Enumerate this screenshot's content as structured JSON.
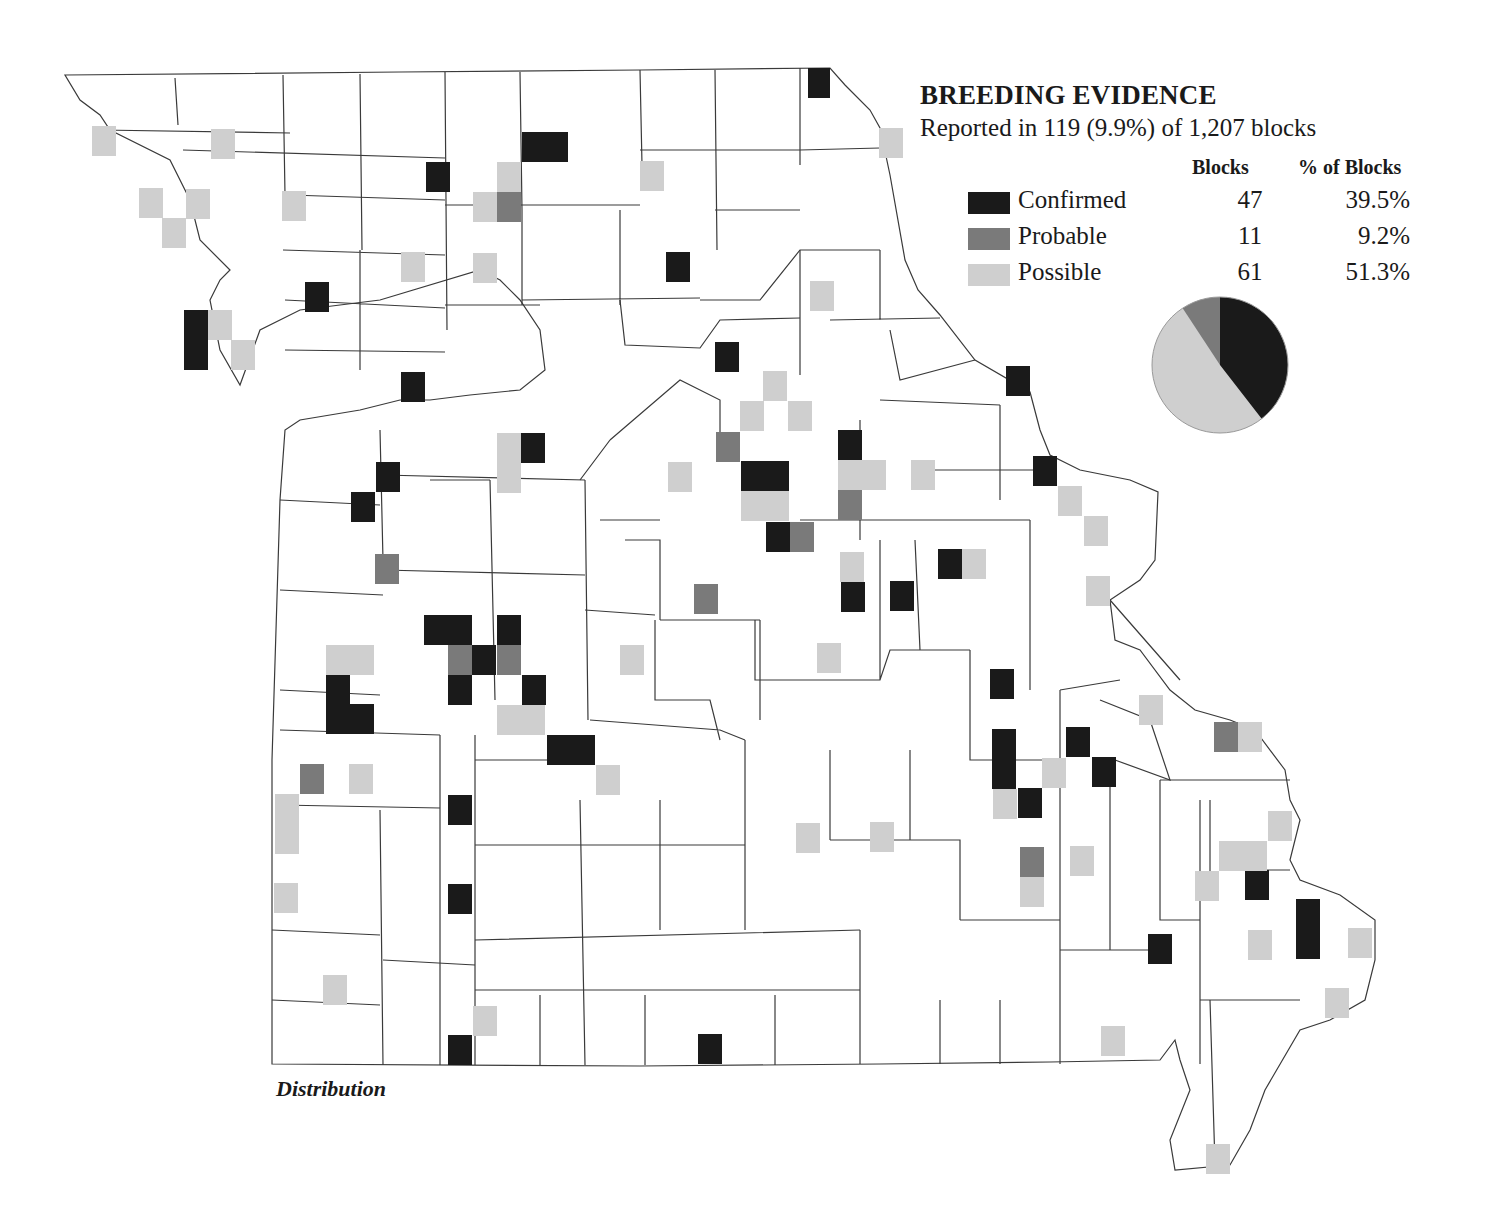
{
  "legend": {
    "title": "BREEDING EVIDENCE",
    "subtitle": "Reported in 119 (9.9%) of 1,207 blocks",
    "col_blocks": "Blocks",
    "col_pct": "% of Blocks",
    "rows": [
      {
        "label": "Confirmed",
        "blocks": "47",
        "pct": "39.5%",
        "color": "#1a1a1a"
      },
      {
        "label": "Probable",
        "blocks": "11",
        "pct": "9.2%",
        "color": "#7a7a7a"
      },
      {
        "label": "Possible",
        "blocks": "61",
        "pct": "51.3%",
        "color": "#cfcfcf"
      }
    ]
  },
  "caption": "Distribution",
  "colors": {
    "confirmed": "#1a1a1a",
    "probable": "#7a7a7a",
    "possible": "#cfcfcf",
    "line": "#333333"
  },
  "chart_data": {
    "type": "pie",
    "title": "BREEDING EVIDENCE",
    "subtitle": "Reported in 119 (9.9%) of 1,207 blocks",
    "categories": [
      "Confirmed",
      "Probable",
      "Possible"
    ],
    "values": [
      47,
      11,
      61
    ],
    "percent": [
      39.5,
      9.2,
      51.3
    ],
    "total_blocks_reported": 119,
    "total_blocks": 1207
  },
  "blocks": [
    {
      "x": 808,
      "y": 68,
      "w": 22,
      "h": 30,
      "t": "confirmed"
    },
    {
      "x": 522,
      "y": 132,
      "w": 46,
      "h": 30,
      "t": "confirmed"
    },
    {
      "x": 426,
      "y": 162,
      "w": 24,
      "h": 30,
      "t": "confirmed"
    },
    {
      "x": 666,
      "y": 252,
      "w": 24,
      "h": 30,
      "t": "confirmed"
    },
    {
      "x": 305,
      "y": 282,
      "w": 24,
      "h": 30,
      "t": "confirmed"
    },
    {
      "x": 184,
      "y": 310,
      "w": 24,
      "h": 60,
      "t": "confirmed"
    },
    {
      "x": 715,
      "y": 342,
      "w": 24,
      "h": 30,
      "t": "confirmed"
    },
    {
      "x": 401,
      "y": 372,
      "w": 24,
      "h": 30,
      "t": "confirmed"
    },
    {
      "x": 1006,
      "y": 366,
      "w": 24,
      "h": 30,
      "t": "confirmed"
    },
    {
      "x": 521,
      "y": 433,
      "w": 24,
      "h": 30,
      "t": "confirmed"
    },
    {
      "x": 838,
      "y": 430,
      "w": 24,
      "h": 30,
      "t": "confirmed"
    },
    {
      "x": 376,
      "y": 462,
      "w": 24,
      "h": 30,
      "t": "confirmed"
    },
    {
      "x": 741,
      "y": 461,
      "w": 48,
      "h": 30,
      "t": "confirmed"
    },
    {
      "x": 1033,
      "y": 456,
      "w": 24,
      "h": 30,
      "t": "confirmed"
    },
    {
      "x": 351,
      "y": 492,
      "w": 24,
      "h": 30,
      "t": "confirmed"
    },
    {
      "x": 766,
      "y": 522,
      "w": 24,
      "h": 30,
      "t": "confirmed"
    },
    {
      "x": 938,
      "y": 549,
      "w": 24,
      "h": 30,
      "t": "confirmed"
    },
    {
      "x": 841,
      "y": 582,
      "w": 24,
      "h": 30,
      "t": "confirmed"
    },
    {
      "x": 890,
      "y": 581,
      "w": 24,
      "h": 30,
      "t": "confirmed"
    },
    {
      "x": 424,
      "y": 615,
      "w": 48,
      "h": 30,
      "t": "confirmed"
    },
    {
      "x": 497,
      "y": 615,
      "w": 24,
      "h": 30,
      "t": "confirmed"
    },
    {
      "x": 472,
      "y": 645,
      "w": 24,
      "h": 30,
      "t": "confirmed"
    },
    {
      "x": 448,
      "y": 675,
      "w": 24,
      "h": 30,
      "t": "confirmed"
    },
    {
      "x": 522,
      "y": 675,
      "w": 24,
      "h": 30,
      "t": "confirmed"
    },
    {
      "x": 990,
      "y": 669,
      "w": 24,
      "h": 30,
      "t": "confirmed"
    },
    {
      "x": 326,
      "y": 674,
      "w": 24,
      "h": 60,
      "t": "confirmed"
    },
    {
      "x": 350,
      "y": 704,
      "w": 24,
      "h": 30,
      "t": "confirmed"
    },
    {
      "x": 547,
      "y": 735,
      "w": 48,
      "h": 30,
      "t": "confirmed"
    },
    {
      "x": 992,
      "y": 729,
      "w": 24,
      "h": 60,
      "t": "confirmed"
    },
    {
      "x": 1066,
      "y": 727,
      "w": 24,
      "h": 30,
      "t": "confirmed"
    },
    {
      "x": 1092,
      "y": 757,
      "w": 24,
      "h": 30,
      "t": "confirmed"
    },
    {
      "x": 1018,
      "y": 788,
      "w": 24,
      "h": 30,
      "t": "confirmed"
    },
    {
      "x": 448,
      "y": 795,
      "w": 24,
      "h": 30,
      "t": "confirmed"
    },
    {
      "x": 1245,
      "y": 870,
      "w": 24,
      "h": 30,
      "t": "confirmed"
    },
    {
      "x": 448,
      "y": 884,
      "w": 24,
      "h": 30,
      "t": "confirmed"
    },
    {
      "x": 1296,
      "y": 899,
      "w": 24,
      "h": 60,
      "t": "confirmed"
    },
    {
      "x": 1148,
      "y": 934,
      "w": 24,
      "h": 30,
      "t": "confirmed"
    },
    {
      "x": 448,
      "y": 1035,
      "w": 24,
      "h": 30,
      "t": "confirmed"
    },
    {
      "x": 698,
      "y": 1034,
      "w": 24,
      "h": 30,
      "t": "confirmed"
    },
    {
      "x": 497,
      "y": 192,
      "w": 24,
      "h": 30,
      "t": "probable"
    },
    {
      "x": 716,
      "y": 432,
      "w": 24,
      "h": 30,
      "t": "probable"
    },
    {
      "x": 838,
      "y": 490,
      "w": 24,
      "h": 30,
      "t": "probable"
    },
    {
      "x": 790,
      "y": 522,
      "w": 24,
      "h": 30,
      "t": "probable"
    },
    {
      "x": 375,
      "y": 554,
      "w": 24,
      "h": 30,
      "t": "probable"
    },
    {
      "x": 694,
      "y": 584,
      "w": 24,
      "h": 30,
      "t": "probable"
    },
    {
      "x": 448,
      "y": 645,
      "w": 24,
      "h": 30,
      "t": "probable"
    },
    {
      "x": 497,
      "y": 645,
      "w": 24,
      "h": 30,
      "t": "probable"
    },
    {
      "x": 1214,
      "y": 722,
      "w": 24,
      "h": 30,
      "t": "probable"
    },
    {
      "x": 300,
      "y": 764,
      "w": 24,
      "h": 30,
      "t": "probable"
    },
    {
      "x": 1020,
      "y": 847,
      "w": 24,
      "h": 30,
      "t": "probable"
    },
    {
      "x": 92,
      "y": 126,
      "w": 24,
      "h": 30,
      "t": "possible"
    },
    {
      "x": 211,
      "y": 129,
      "w": 24,
      "h": 30,
      "t": "possible"
    },
    {
      "x": 879,
      "y": 128,
      "w": 24,
      "h": 30,
      "t": "possible"
    },
    {
      "x": 640,
      "y": 161,
      "w": 24,
      "h": 30,
      "t": "possible"
    },
    {
      "x": 497,
      "y": 162,
      "w": 24,
      "h": 30,
      "t": "possible"
    },
    {
      "x": 139,
      "y": 188,
      "w": 24,
      "h": 30,
      "t": "possible"
    },
    {
      "x": 186,
      "y": 189,
      "w": 24,
      "h": 30,
      "t": "possible"
    },
    {
      "x": 282,
      "y": 191,
      "w": 24,
      "h": 30,
      "t": "possible"
    },
    {
      "x": 473,
      "y": 192,
      "w": 24,
      "h": 30,
      "t": "possible"
    },
    {
      "x": 162,
      "y": 218,
      "w": 24,
      "h": 30,
      "t": "possible"
    },
    {
      "x": 401,
      "y": 252,
      "w": 24,
      "h": 30,
      "t": "possible"
    },
    {
      "x": 473,
      "y": 253,
      "w": 24,
      "h": 30,
      "t": "possible"
    },
    {
      "x": 810,
      "y": 281,
      "w": 24,
      "h": 30,
      "t": "possible"
    },
    {
      "x": 208,
      "y": 310,
      "w": 24,
      "h": 30,
      "t": "possible"
    },
    {
      "x": 231,
      "y": 340,
      "w": 24,
      "h": 30,
      "t": "possible"
    },
    {
      "x": 763,
      "y": 371,
      "w": 24,
      "h": 30,
      "t": "possible"
    },
    {
      "x": 740,
      "y": 401,
      "w": 24,
      "h": 30,
      "t": "possible"
    },
    {
      "x": 788,
      "y": 401,
      "w": 24,
      "h": 30,
      "t": "possible"
    },
    {
      "x": 497,
      "y": 433,
      "w": 24,
      "h": 60,
      "t": "possible"
    },
    {
      "x": 838,
      "y": 460,
      "w": 48,
      "h": 30,
      "t": "possible"
    },
    {
      "x": 668,
      "y": 462,
      "w": 24,
      "h": 30,
      "t": "possible"
    },
    {
      "x": 911,
      "y": 460,
      "w": 24,
      "h": 30,
      "t": "possible"
    },
    {
      "x": 741,
      "y": 491,
      "w": 48,
      "h": 30,
      "t": "possible"
    },
    {
      "x": 1058,
      "y": 486,
      "w": 24,
      "h": 30,
      "t": "possible"
    },
    {
      "x": 1084,
      "y": 516,
      "w": 24,
      "h": 30,
      "t": "possible"
    },
    {
      "x": 840,
      "y": 552,
      "w": 24,
      "h": 30,
      "t": "possible"
    },
    {
      "x": 962,
      "y": 549,
      "w": 24,
      "h": 30,
      "t": "possible"
    },
    {
      "x": 1086,
      "y": 576,
      "w": 24,
      "h": 30,
      "t": "possible"
    },
    {
      "x": 326,
      "y": 645,
      "w": 48,
      "h": 30,
      "t": "possible"
    },
    {
      "x": 620,
      "y": 645,
      "w": 24,
      "h": 30,
      "t": "possible"
    },
    {
      "x": 817,
      "y": 643,
      "w": 24,
      "h": 30,
      "t": "possible"
    },
    {
      "x": 1139,
      "y": 695,
      "w": 24,
      "h": 30,
      "t": "possible"
    },
    {
      "x": 497,
      "y": 705,
      "w": 48,
      "h": 30,
      "t": "possible"
    },
    {
      "x": 1238,
      "y": 722,
      "w": 24,
      "h": 30,
      "t": "possible"
    },
    {
      "x": 1042,
      "y": 758,
      "w": 24,
      "h": 30,
      "t": "possible"
    },
    {
      "x": 349,
      "y": 764,
      "w": 24,
      "h": 30,
      "t": "possible"
    },
    {
      "x": 596,
      "y": 765,
      "w": 24,
      "h": 30,
      "t": "possible"
    },
    {
      "x": 275,
      "y": 794,
      "w": 24,
      "h": 60,
      "t": "possible"
    },
    {
      "x": 993,
      "y": 789,
      "w": 24,
      "h": 30,
      "t": "possible"
    },
    {
      "x": 1268,
      "y": 811,
      "w": 24,
      "h": 30,
      "t": "possible"
    },
    {
      "x": 796,
      "y": 823,
      "w": 24,
      "h": 30,
      "t": "possible"
    },
    {
      "x": 870,
      "y": 822,
      "w": 24,
      "h": 30,
      "t": "possible"
    },
    {
      "x": 1219,
      "y": 841,
      "w": 48,
      "h": 30,
      "t": "possible"
    },
    {
      "x": 1070,
      "y": 846,
      "w": 24,
      "h": 30,
      "t": "possible"
    },
    {
      "x": 1020,
      "y": 877,
      "w": 24,
      "h": 30,
      "t": "possible"
    },
    {
      "x": 1195,
      "y": 871,
      "w": 24,
      "h": 30,
      "t": "possible"
    },
    {
      "x": 274,
      "y": 883,
      "w": 24,
      "h": 30,
      "t": "possible"
    },
    {
      "x": 1248,
      "y": 930,
      "w": 24,
      "h": 30,
      "t": "possible"
    },
    {
      "x": 1348,
      "y": 928,
      "w": 24,
      "h": 30,
      "t": "possible"
    },
    {
      "x": 323,
      "y": 975,
      "w": 24,
      "h": 30,
      "t": "possible"
    },
    {
      "x": 1325,
      "y": 988,
      "w": 24,
      "h": 30,
      "t": "possible"
    },
    {
      "x": 473,
      "y": 1006,
      "w": 24,
      "h": 30,
      "t": "possible"
    },
    {
      "x": 1101,
      "y": 1026,
      "w": 24,
      "h": 30,
      "t": "possible"
    },
    {
      "x": 1206,
      "y": 1144,
      "w": 24,
      "h": 30,
      "t": "possible"
    }
  ]
}
